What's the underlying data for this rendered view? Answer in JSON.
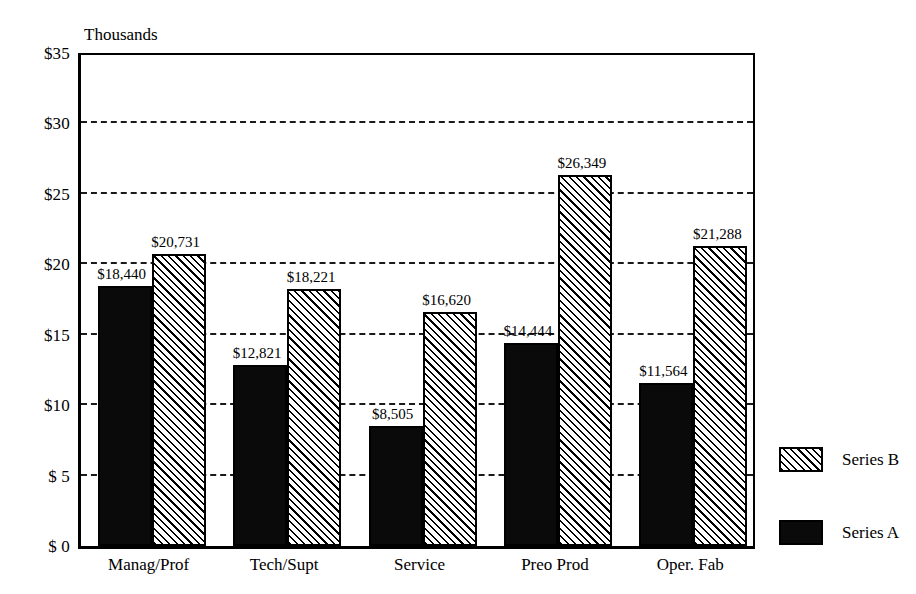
{
  "chart_data": {
    "type": "bar",
    "title": "",
    "subtitle": "",
    "unit_caption": "Thousands",
    "categories": [
      "Manag/Prof",
      "Tech/Supt",
      "Service",
      "Preo Prod",
      "Oper. Fab"
    ],
    "series": [
      {
        "name": "Series A",
        "fill": "solid-black",
        "values": [
          18440,
          12821,
          8505,
          14444,
          11564
        ],
        "labels": [
          "$18,440",
          "$12,821",
          "$8,505",
          "$14,444",
          "$11,564"
        ]
      },
      {
        "name": "Series B",
        "fill": "diagonal-hatch",
        "values": [
          20731,
          18221,
          16620,
          26349,
          21288
        ],
        "labels": [
          "$20,731",
          "$18,221",
          "$16,620",
          "$26,349",
          "$21,288"
        ]
      }
    ],
    "xlabel": "",
    "ylabel": "",
    "ylim": [
      0,
      35000
    ],
    "yticks": [
      0,
      5000,
      10000,
      15000,
      20000,
      25000,
      30000,
      35000
    ],
    "ytick_labels": [
      "$ 0",
      "$ 5",
      "$10",
      "$15",
      "$20",
      "$25",
      "$30",
      "$35"
    ],
    "grid": true,
    "grid_style": "dashed-horizontal",
    "legend_position": "right",
    "legend_order": [
      "Series B",
      "Series A"
    ],
    "colors": {
      "axis": "#000000",
      "gridline": "#1a1a1a",
      "series_a": "#0a0a0a",
      "series_b": "#ffffff",
      "background": "#ffffff",
      "text": "#000000"
    }
  },
  "legend": {
    "items": [
      {
        "label": "Series B",
        "fill": "diagonal-hatch"
      },
      {
        "label": "Series A",
        "fill": "solid-black"
      }
    ]
  }
}
